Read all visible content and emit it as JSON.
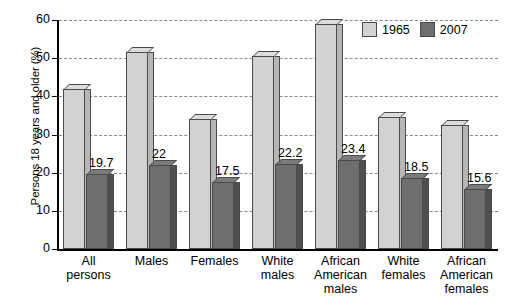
{
  "chart_data": {
    "type": "bar",
    "title": "",
    "xlabel": "",
    "ylabel": "Persons 18 years and older (%)",
    "ylim": [
      0,
      60
    ],
    "yticks": [
      0,
      10,
      20,
      30,
      40,
      50,
      60
    ],
    "grid": true,
    "legend_position": "top-right",
    "categories": [
      "All persons",
      "Males",
      "Females",
      "White males",
      "African American males",
      "White females",
      "African American females"
    ],
    "category_lines": [
      [
        "All",
        "persons"
      ],
      [
        "Males"
      ],
      [
        "Females"
      ],
      [
        "White",
        "males"
      ],
      [
        "African",
        "American",
        "males"
      ],
      [
        "White",
        "females"
      ],
      [
        "African",
        "American",
        "females"
      ]
    ],
    "series": [
      {
        "name": "1965",
        "color": "#d2d2d2",
        "values": [
          42.0,
          51.5,
          34.0,
          50.7,
          59.0,
          34.5,
          32.5
        ],
        "labels": [
          "",
          "",
          "",
          "",
          "",
          "",
          ""
        ]
      },
      {
        "name": "2007",
        "color": "#6e6e6e",
        "values": [
          19.7,
          22.0,
          17.5,
          22.2,
          23.4,
          18.5,
          15.6
        ],
        "labels": [
          "19.7",
          "22",
          "17.5",
          "22.2",
          "23.4",
          "18.5",
          "15.6"
        ]
      }
    ]
  },
  "legend": {
    "items": [
      {
        "label": "1965",
        "color": "#d2d2d2"
      },
      {
        "label": "2007",
        "color": "#6e6e6e"
      }
    ]
  },
  "axis": {
    "y_title": "Persons 18 years and older (%)",
    "y_tick_labels": [
      "60",
      "50",
      "40",
      "30",
      "20",
      "10",
      "0"
    ]
  }
}
